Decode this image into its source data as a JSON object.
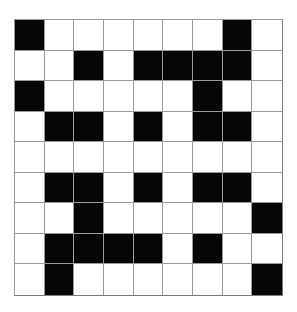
{
  "page": {
    "background_color": "#ffffff"
  },
  "grid": {
    "name": "binary-cell-grid",
    "rows": 9,
    "columns": 9,
    "cell_size_px": 30,
    "origin_x_px": 14,
    "origin_y_px": 19,
    "width_px": 269,
    "height_px": 277,
    "line_color": "#9a9a9a",
    "border_color": "#7d7d7d",
    "filled_color": "#060606",
    "empty_color": "#ffffff",
    "legend": {
      "0": "empty",
      "1": "filled"
    },
    "filled_count": 35,
    "empty_count": 46,
    "cells": [
      [
        1,
        0,
        0,
        0,
        0,
        0,
        0,
        1,
        0
      ],
      [
        0,
        0,
        1,
        0,
        1,
        1,
        1,
        1,
        0
      ],
      [
        1,
        0,
        0,
        0,
        0,
        0,
        1,
        0,
        0
      ],
      [
        0,
        1,
        1,
        0,
        1,
        0,
        1,
        1,
        0
      ],
      [
        0,
        0,
        0,
        0,
        0,
        0,
        0,
        0,
        0
      ],
      [
        0,
        1,
        1,
        0,
        1,
        0,
        1,
        1,
        0
      ],
      [
        0,
        0,
        1,
        0,
        0,
        0,
        0,
        0,
        1
      ],
      [
        0,
        1,
        1,
        1,
        1,
        0,
        1,
        0,
        0
      ],
      [
        0,
        1,
        0,
        0,
        0,
        0,
        0,
        0,
        1
      ]
    ],
    "row_filled_counts": [
      2,
      5,
      2,
      5,
      0,
      5,
      2,
      5,
      2
    ],
    "column_filled_counts": [
      2,
      4,
      5,
      1,
      3,
      1,
      5,
      3,
      2
    ]
  }
}
